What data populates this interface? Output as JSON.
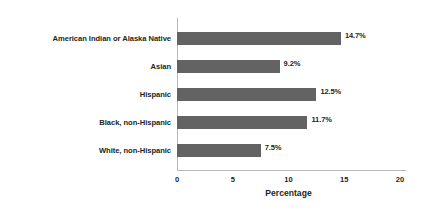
{
  "chart_data": {
    "type": "bar",
    "orientation": "horizontal",
    "title": "",
    "xlabel": "Percentage",
    "ylabel": "",
    "xlim": [
      0,
      20
    ],
    "xticks": [
      0,
      5,
      10,
      15,
      20
    ],
    "xtick_labels": [
      "0",
      "5",
      "10",
      "15",
      "20"
    ],
    "grid": false,
    "legend": false,
    "categories": [
      "American Indian or Alaska Native",
      "Asian",
      "Hispanic",
      "Black, non-Hispanic",
      "White, non-Hispanic"
    ],
    "values": [
      14.7,
      9.2,
      12.5,
      11.7,
      7.5
    ],
    "value_labels": [
      "14.7%",
      "9.2%",
      "12.5%",
      "11.7%",
      "7.5%"
    ],
    "bar_color": "#636363",
    "text_color": "#231f20",
    "axis_color": "#b9b9b9",
    "background_color": "#ffffff"
  }
}
